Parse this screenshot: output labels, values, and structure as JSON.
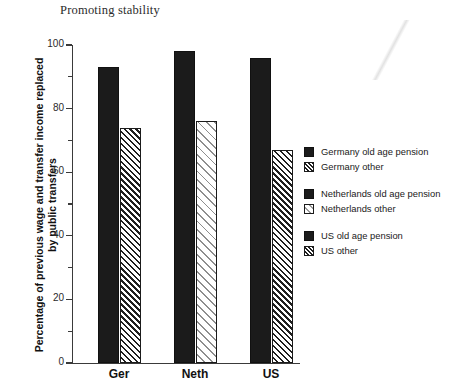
{
  "chart_data": {
    "type": "bar",
    "title": "Promoting stability",
    "xlabel": "",
    "ylabel": "Percentage of previous wage and transfer income replaced by public transfers",
    "categories": [
      "Ger",
      "Neth",
      "US"
    ],
    "ylim": [
      0,
      100
    ],
    "ytick_labels": [
      "0",
      "20",
      "40",
      "60",
      "80",
      "100"
    ],
    "ytick_values": [
      0,
      20,
      40,
      60,
      80,
      100
    ],
    "minor_tick_values": [
      10,
      30,
      50,
      70,
      90
    ],
    "grid": false,
    "legend_position": "right",
    "series": [
      {
        "name": "Germany old age pension",
        "category": "Ger",
        "pattern": "solid",
        "value": 93
      },
      {
        "name": "Germany other",
        "category": "Ger",
        "pattern": "hatch-dense",
        "value": 74
      },
      {
        "name": "Netherlands old age pension",
        "category": "Neth",
        "pattern": "solid",
        "value": 98
      },
      {
        "name": "Netherlands other",
        "category": "Neth",
        "pattern": "hatch-light",
        "value": 76
      },
      {
        "name": "US old age pension",
        "category": "US",
        "pattern": "solid",
        "value": 96
      },
      {
        "name": "US other",
        "category": "US",
        "pattern": "hatch-dense",
        "value": 67
      }
    ],
    "legend": [
      {
        "label": "Germany old age pension",
        "swatch": "solid"
      },
      {
        "label": "Germany other",
        "swatch": "hatch-dense"
      },
      {
        "label": "Netherlands old age pension",
        "swatch": "solid"
      },
      {
        "label": "Netherlands other",
        "swatch": "hatch-light"
      },
      {
        "label": "US old age pension",
        "swatch": "solid"
      },
      {
        "label": "US other",
        "swatch": "hatch-dense"
      }
    ],
    "colors": {
      "bar_solid": "#1b1b1b",
      "hatch_dark": "#1f1f1f",
      "hatch_light": "#8e8e8e",
      "axis": "#3a3a3a",
      "background": "#ffffff",
      "text": "#1a1a1a"
    }
  }
}
